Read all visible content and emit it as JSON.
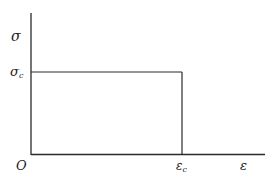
{
  "diagram": {
    "type": "stress-strain",
    "labels": {
      "y_axis": "σ",
      "y_tick": "σ",
      "y_tick_sub": "c",
      "origin": "O",
      "x_tick": "ε",
      "x_tick_sub": "c",
      "x_axis": "ε"
    },
    "colors": {
      "line": "#2b2b2b",
      "background": "#ffffff"
    }
  }
}
